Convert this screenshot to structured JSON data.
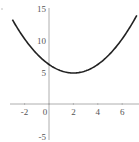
{
  "chart_data": {
    "type": "line",
    "title": "",
    "xlabel": "",
    "ylabel": "",
    "function": "y = (x - 2)^2 / 3 + 5",
    "xlim": [
      -3,
      7.2
    ],
    "ylim": [
      -5,
      15
    ],
    "grid": false,
    "x_ticks": [
      "-2",
      "0",
      "2",
      "4",
      "6"
    ],
    "y_ticks": [
      "15",
      "10",
      "5",
      "-5"
    ],
    "series": [
      {
        "name": "parabola",
        "x": [
          -3,
          -2,
          -1,
          0,
          1,
          2,
          3,
          4,
          5,
          6,
          7
        ],
        "values": [
          13.3,
          10.3,
          8.0,
          6.3,
          5.3,
          5.0,
          5.3,
          6.3,
          8.0,
          10.3,
          13.3
        ]
      }
    ],
    "vertex": {
      "x": 2,
      "y": 5
    },
    "colors": {
      "curve": "#222222",
      "axis": "#999999"
    }
  }
}
